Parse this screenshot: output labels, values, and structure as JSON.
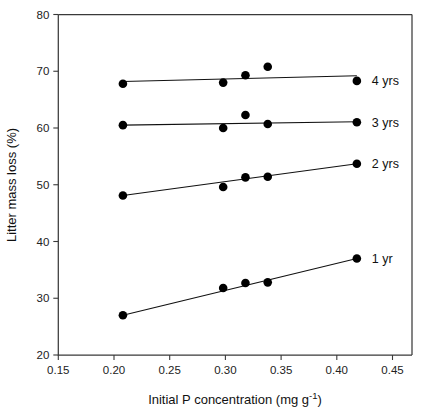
{
  "chart_data": {
    "type": "scatter",
    "title": "",
    "xlabel": "Initial P concentration (mg g -1)",
    "xlabel_main": "Initial P concentration (mg g",
    "xlabel_sup": "-1",
    "xlabel_tail": ")",
    "ylabel": "Litter mass loss (%)",
    "xlim": [
      0.15,
      0.4675
    ],
    "ylim": [
      20,
      80
    ],
    "xticks": [
      0.15,
      0.2,
      0.25,
      0.3,
      0.35,
      0.4,
      0.45
    ],
    "xticklabels": [
      "0.15",
      "0.20",
      "0.25",
      "0.30",
      "0.35",
      "0.40",
      "0.45"
    ],
    "yticks": [
      20,
      30,
      40,
      50,
      60,
      70,
      80
    ],
    "yticklabels": [
      "20",
      "30",
      "40",
      "50",
      "60",
      "70",
      "80"
    ],
    "grid": false,
    "legend_position": "right-inline",
    "marker": "filled-circle",
    "marker_color": "#000000",
    "line_color": "#111111",
    "x": [
      0.208,
      0.298,
      0.318,
      0.338,
      0.418
    ],
    "series": [
      {
        "name": "4 yrs",
        "label": "4 yrs",
        "values": [
          67.8,
          68.0,
          69.3,
          70.8,
          68.3
        ],
        "fit_endpoints": [
          [
            0.208,
            68.2
          ],
          [
            0.418,
            69.2
          ]
        ]
      },
      {
        "name": "3 yrs",
        "label": "3 yrs",
        "values": [
          60.5,
          60.0,
          62.3,
          60.7,
          61.0
        ],
        "fit_endpoints": [
          [
            0.208,
            60.5
          ],
          [
            0.418,
            61.1
          ]
        ]
      },
      {
        "name": "2 yrs",
        "label": "2 yrs",
        "values": [
          48.1,
          49.6,
          51.3,
          51.4,
          53.7
        ],
        "fit_endpoints": [
          [
            0.208,
            48.1
          ],
          [
            0.418,
            53.7
          ]
        ]
      },
      {
        "name": "1 yr",
        "label": "1 yr",
        "values": [
          27.0,
          31.8,
          32.7,
          32.8,
          37.0
        ],
        "fit_endpoints": [
          [
            0.208,
            27.0
          ],
          [
            0.418,
            37.0
          ]
        ]
      }
    ]
  },
  "labels": {
    "series_4yrs": "4 yrs",
    "series_3yrs": "3 yrs",
    "series_2yrs": "2 yrs",
    "series_1yr": "1 yr",
    "y_axis_title": "Litter mass loss (%)",
    "x_axis_title_main": "Initial P concentration (mg g",
    "x_axis_title_sup": "-1",
    "x_axis_title_tail": ")",
    "xtick_0": "0.15",
    "xtick_1": "0.20",
    "xtick_2": "0.25",
    "xtick_3": "0.30",
    "xtick_4": "0.35",
    "xtick_5": "0.40",
    "xtick_6": "0.45",
    "ytick_0": "20",
    "ytick_1": "30",
    "ytick_2": "40",
    "ytick_3": "50",
    "ytick_4": "60",
    "ytick_5": "70",
    "ytick_6": "80"
  }
}
